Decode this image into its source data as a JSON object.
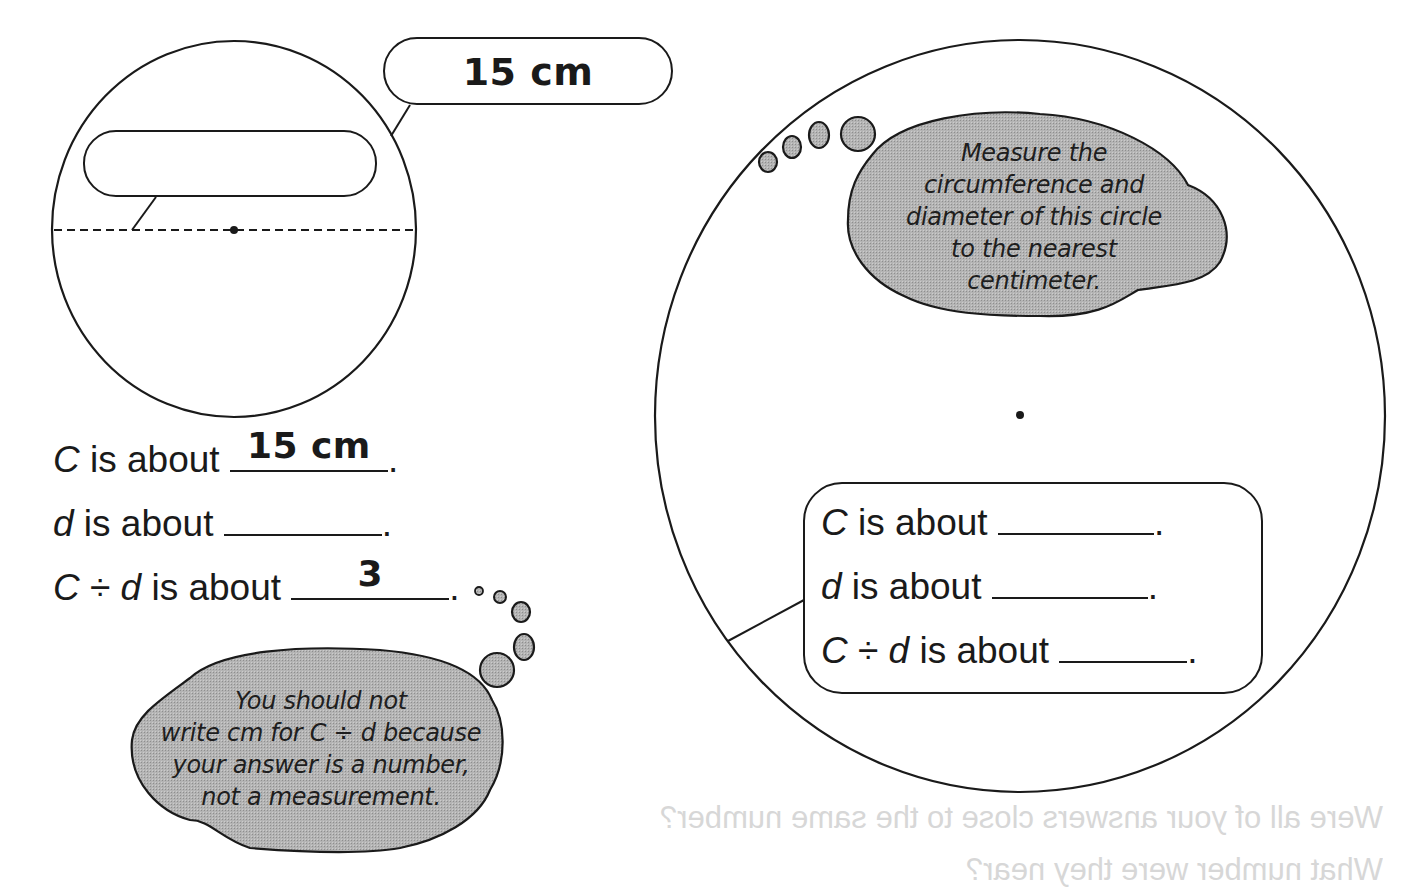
{
  "colors": {
    "ink": "#1a1a1a",
    "bubble_fill": "#a9a9a9",
    "paper": "#ffffff",
    "bleed_through": "#d7d7d7"
  },
  "small_circle": {
    "circumference_callout": "15 cm",
    "diameter_callout": "",
    "answers": [
      {
        "var": "C",
        "prefix": "",
        "suffix": " is about",
        "answer": "15 cm",
        "end": "."
      },
      {
        "var": "d",
        "prefix": "",
        "suffix": " is about",
        "answer": "",
        "end": "."
      },
      {
        "var": "C",
        "op": " ÷ ",
        "var2": "d",
        "suffix": " is about",
        "answer": "3",
        "end": "."
      }
    ],
    "thought_bubble": {
      "lines": [
        "You should not",
        "write cm for C ÷ d because",
        "your answer is a number,",
        "not a measurement."
      ]
    }
  },
  "large_circle": {
    "thought_bubble": {
      "lines": [
        "Measure the",
        "circumference and",
        "diameter of this circle",
        "to the nearest",
        "centimeter."
      ]
    },
    "answers": [
      {
        "var": "C",
        "suffix": " is about",
        "answer": "",
        "end": "."
      },
      {
        "var": "d",
        "suffix": " is about",
        "answer": "",
        "end": "."
      },
      {
        "var": "C",
        "op": " ÷ ",
        "var2": "d",
        "suffix": " is about",
        "answer": "",
        "end": "."
      }
    ]
  },
  "bleed_through": {
    "line1": "Were all of your answers close to the same number?",
    "line2": "What number were they near?"
  }
}
